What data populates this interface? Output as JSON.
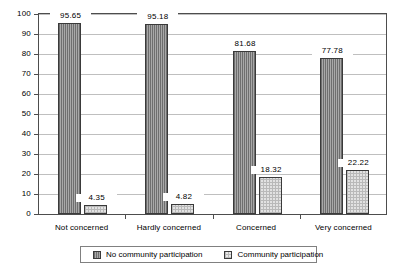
{
  "chart_data": {
    "type": "bar",
    "title": "",
    "subtitle": "",
    "xlabel": "",
    "ylabel": "",
    "categories": [
      "Not concerned",
      "Hardly concerned",
      "Concerned",
      "Very concerned"
    ],
    "series": [
      {
        "name": "No community participation",
        "values": [
          95.65,
          95.18,
          81.68,
          77.78
        ]
      },
      {
        "name": "Community participation",
        "values": [
          4.35,
          4.82,
          18.32,
          22.22
        ]
      }
    ],
    "ylim": [
      0,
      100
    ],
    "ytick_values": [
      0,
      10,
      20,
      30,
      40,
      50,
      60,
      70,
      80,
      90,
      100
    ],
    "ytick_labels": [
      "0",
      "10",
      "20",
      "30",
      "40",
      "50",
      "60",
      "70",
      "80",
      "90",
      "100"
    ],
    "grid": true,
    "grid_axis": "y",
    "legend_position": "bottom-center",
    "data_labels": true,
    "colors": {
      "series_0_fill": "#8f8f8f",
      "series_0_hatch": "#6e6e6e",
      "series_1_fill": "#e2e2e2",
      "series_1_hatch": "#b9b9b9",
      "bar_border": "#3a3a3a",
      "gridline": "#bfbfbf",
      "axis": "#4d4d4d",
      "background": "#ffffff",
      "legend_border": "#808080"
    }
  }
}
